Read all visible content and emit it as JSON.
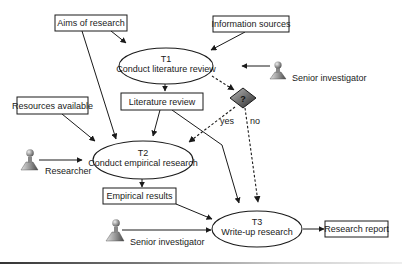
{
  "diagram": {
    "inputs": {
      "aims": "Aims of research",
      "info_sources": "Information sources",
      "resources": "Resources available"
    },
    "tasks": {
      "t1": {
        "id": "T1",
        "label": "Conduct literature review"
      },
      "t2": {
        "id": "T2",
        "label": "Conduct empirical research"
      },
      "t3": {
        "id": "T3",
        "label": "Write-up research"
      }
    },
    "outputs": {
      "literature_review": "Literature review",
      "empirical_results": "Empirical results",
      "research_report": "Research report"
    },
    "actors": {
      "senior_top": "Senior investigator",
      "researcher": "Researcher",
      "senior_bottom": "Senior investigator"
    },
    "decision": {
      "symbol": "?",
      "yes_label": "yes",
      "no_label": "no"
    },
    "colors": {
      "line": "#1a1a1a",
      "decision_dark": "#2a2a2a",
      "decision_light": "#bdbdbd"
    }
  }
}
